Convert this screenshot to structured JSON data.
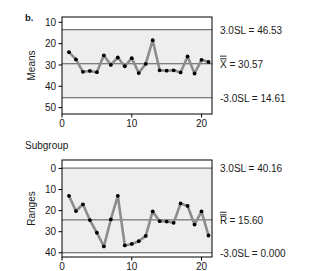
{
  "figure": {
    "panel_label": "b.",
    "xaxis_title": "Subgroup"
  },
  "chart_data": [
    {
      "type": "line",
      "title": "",
      "subtitle": "",
      "xlabel": "Subgroup",
      "ylabel": "Means",
      "xlim": [
        0,
        21.5
      ],
      "ylim": [
        7.0,
        52.5
      ],
      "xticks": [
        0,
        10,
        20
      ],
      "yticks": [
        10,
        20,
        30,
        40,
        50
      ],
      "grid": false,
      "legend": "none",
      "x": [
        1,
        2,
        3,
        4,
        5,
        6,
        7,
        8,
        9,
        10,
        11,
        12,
        13,
        14,
        15,
        16,
        17,
        18,
        19,
        20,
        21
      ],
      "values": [
        36.0,
        32.6,
        26.8,
        27.2,
        26.6,
        34.5,
        30.0,
        33.5,
        29.4,
        33.2,
        26.2,
        30.5,
        41.6,
        27.5,
        27.3,
        27.5,
        26.5,
        34.0,
        26.0,
        32.4,
        31.4
      ],
      "control_lines": [
        {
          "name": "3.0SL",
          "label": "3.0SL = 46.53",
          "value": 46.53
        },
        {
          "name": "center",
          "label": "X̅̅ = 30.57",
          "value": 30.57
        },
        {
          "name": "-3.0SL",
          "label": "-3.0SL = 14.61",
          "value": 14.61
        }
      ],
      "annotations": [
        "3.0SL = 46.53",
        "X̅̅ = 30.57",
        "-3.0SL = 14.61"
      ]
    },
    {
      "type": "line",
      "title": "",
      "subtitle": "",
      "xlabel": "Subgroup",
      "ylabel": "Ranges",
      "xlim": [
        0,
        21.5
      ],
      "ylim": [
        -2.0,
        44.0
      ],
      "xticks": [
        0,
        10,
        20
      ],
      "yticks": [
        0,
        10,
        20,
        30,
        40
      ],
      "grid": false,
      "legend": "none",
      "x": [
        1,
        2,
        3,
        4,
        5,
        6,
        7,
        8,
        9,
        10,
        11,
        12,
        13,
        14,
        15,
        16,
        17,
        18,
        19,
        20,
        21
      ],
      "values": [
        27.0,
        19.8,
        23.0,
        15.5,
        9.5,
        3.0,
        15.8,
        27.0,
        3.5,
        4.2,
        5.5,
        8.0,
        19.6,
        15.0,
        14.8,
        14.2,
        23.4,
        22.2,
        13.4,
        19.6,
        8.2
      ],
      "control_lines": [
        {
          "name": "3.0SL",
          "label": "3.0SL = 40.16",
          "value": 40.16
        },
        {
          "name": "center",
          "label": "R̅̅ = 15.60",
          "value": 15.6
        },
        {
          "name": "-3.0SL",
          "label": "-3.0SL = 0.000",
          "value": 0.0
        }
      ],
      "annotations": [
        "3.0SL = 40.16",
        "R̅̅ = 15.60",
        "-3.0SL = 0.000"
      ]
    }
  ],
  "means_chart": {
    "ylabel": "Means",
    "ytick_labels": [
      "50",
      "40",
      "30",
      "20",
      "10"
    ],
    "xtick_labels": [
      "0",
      "10",
      "20"
    ],
    "ucl_label": "3.0SL = 46.53",
    "center_label": "= 30.57",
    "center_symbol": "X",
    "lcl_label": "-3.0SL = 14.61"
  },
  "ranges_chart": {
    "ylabel": "Ranges",
    "ytick_labels": [
      "40",
      "30",
      "20",
      "10",
      "0"
    ],
    "xtick_labels": [
      "0",
      "10",
      "20"
    ],
    "ucl_label": "3.0SL = 40.16",
    "center_label": "= 15.60",
    "center_symbol": "R",
    "lcl_label": "-3.0SL = 0.000"
  },
  "colors": {
    "plot_background": "#eeeeee",
    "series_line": "#8c8c8c",
    "marker": "#000000",
    "control_line": "#444444",
    "frame": "#000000",
    "text": "#1a1a1a"
  }
}
